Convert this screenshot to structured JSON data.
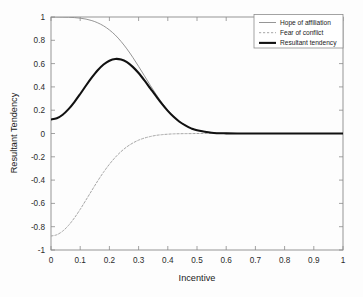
{
  "chart_data": {
    "type": "line",
    "title": "",
    "xlabel": "Incentive",
    "ylabel": "Resultant Tendency",
    "xlim": [
      0,
      1
    ],
    "ylim": [
      -1,
      1
    ],
    "grid": false,
    "legend_position": "top-right",
    "xticks": [
      "0",
      "0.1",
      "0.2",
      "0.3",
      "0.4",
      "0.5",
      "0.6",
      "0.7",
      "0.8",
      "0.9",
      "1"
    ],
    "xtick_values": [
      0,
      0.1,
      0.2,
      0.3,
      0.4,
      0.5,
      0.6,
      0.7,
      0.8,
      0.9,
      1
    ],
    "yticks": [
      "1",
      "0.8",
      "0.6",
      "0.4",
      "0.2",
      "0",
      "-0.2",
      "-0.4",
      "-0.6",
      "-0.8",
      "-1"
    ],
    "ytick_values": [
      1,
      0.8,
      0.6,
      0.4,
      0.2,
      0,
      -0.2,
      -0.4,
      -0.6,
      -0.8,
      -1
    ],
    "x": [
      0,
      0.02,
      0.04,
      0.06,
      0.08,
      0.1,
      0.12,
      0.14,
      0.16,
      0.18,
      0.2,
      0.22,
      0.24,
      0.26,
      0.28,
      0.3,
      0.32,
      0.34,
      0.36,
      0.38,
      0.4,
      0.42,
      0.44,
      0.46,
      0.48,
      0.5,
      0.55,
      0.6,
      0.65,
      0.7,
      0.75,
      0.8,
      0.85,
      0.9,
      0.95,
      1
    ],
    "series": [
      {
        "name": "Hope of affiliation",
        "color": "#8a8a8a",
        "style": "solid",
        "width": 0.9,
        "values": [
          1.0,
          1.0,
          0.999,
          0.998,
          0.995,
          0.99,
          0.982,
          0.969,
          0.95,
          0.924,
          0.889,
          0.845,
          0.79,
          0.726,
          0.654,
          0.576,
          0.495,
          0.414,
          0.336,
          0.264,
          0.2,
          0.146,
          0.103,
          0.07,
          0.045,
          0.028,
          0.007,
          0.001,
          0.0,
          0.0,
          0.0,
          0.0,
          0.0,
          0.0,
          0.0,
          0.0
        ]
      },
      {
        "name": "Fear of conflict",
        "color": "#9c9c9c",
        "style": "dashed",
        "width": 0.9,
        "values": [
          -0.88,
          -0.869,
          -0.838,
          -0.789,
          -0.725,
          -0.651,
          -0.57,
          -0.488,
          -0.407,
          -0.332,
          -0.264,
          -0.205,
          -0.155,
          -0.114,
          -0.082,
          -0.057,
          -0.039,
          -0.026,
          -0.016,
          -0.01,
          -0.006,
          -0.003,
          -0.002,
          -0.001,
          -0.001,
          0.0,
          0.0,
          0.0,
          0.0,
          0.0,
          0.0,
          0.0,
          0.0,
          0.0,
          0.0,
          0.0
        ]
      },
      {
        "name": "Resultant tendency",
        "color": "#111111",
        "style": "solid",
        "width": 2.1,
        "values": [
          0.12,
          0.131,
          0.161,
          0.209,
          0.27,
          0.339,
          0.412,
          0.481,
          0.543,
          0.592,
          0.625,
          0.64,
          0.635,
          0.612,
          0.572,
          0.519,
          0.456,
          0.388,
          0.32,
          0.254,
          0.194,
          0.143,
          0.101,
          0.069,
          0.044,
          0.028,
          0.007,
          0.001,
          0.0,
          0.0,
          0.0,
          0.0,
          0.0,
          0.0,
          0.0,
          0.0
        ]
      }
    ],
    "peak": {
      "x": 0.2,
      "y": 0.76
    }
  },
  "legend": {
    "items": [
      {
        "label": "Hope of affiliation"
      },
      {
        "label": "Fear of conflict"
      },
      {
        "label": "Resultant tendency"
      }
    ]
  }
}
